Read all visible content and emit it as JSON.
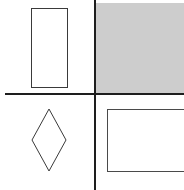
{
  "figure": {
    "layout": "2x2 quadrant grid",
    "colors": {
      "background": "#ffffff",
      "shaded_quadrant": "#cdcdcd",
      "divider_lines": "#1e1e1e",
      "shape_stroke": "#3a3a3a"
    },
    "quadrants": [
      {
        "position": "top-left",
        "shaded": false,
        "shape": "tall-rectangle"
      },
      {
        "position": "top-right",
        "shaded": true,
        "shape": "none"
      },
      {
        "position": "bottom-left",
        "shaded": false,
        "shape": "diamond"
      },
      {
        "position": "bottom-right",
        "shaded": false,
        "shape": "wide-rectangle"
      }
    ]
  }
}
